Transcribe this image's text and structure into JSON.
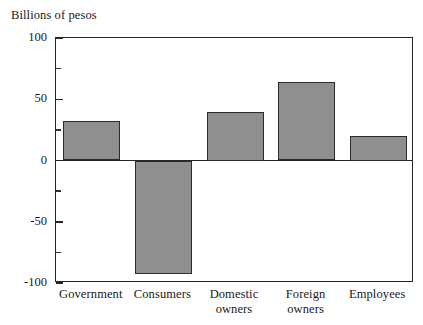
{
  "chart_data": {
    "type": "bar",
    "title": "Billions of pesos",
    "xlabel": "",
    "ylabel": "Billions of pesos",
    "ylim": [
      -100,
      100
    ],
    "grid": false,
    "legend": "none",
    "y_ticks_major": [
      100,
      50,
      0,
      -50,
      -100
    ],
    "y_tick_labels": [
      "100",
      "50",
      "0",
      "-50",
      "-100"
    ],
    "y_ticks_minor": [
      75,
      25,
      -25,
      -75
    ],
    "bar_fill_color": "#8f8f8f",
    "bar_edge_color": "#2b2b2b",
    "axis_color": "#262626",
    "categories": [
      "Government",
      "Consumers",
      "Domestic\nowners",
      "Foreign\nowners",
      "Employees"
    ],
    "values": [
      32,
      -93,
      40,
      64,
      20
    ]
  }
}
